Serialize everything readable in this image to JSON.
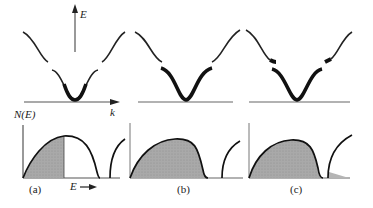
{
  "figure": {
    "axis_labels": {
      "energy": "E",
      "wavevector": "k",
      "density_of_states": "N(E)",
      "energy_arrow": "E"
    },
    "panels": [
      {
        "id": "a",
        "caption": "(a)",
        "description": "Partially filled lower band; states filled up to mid-band"
      },
      {
        "id": "b",
        "caption": "(b)",
        "description": "Lower band completely filled, upper band empty"
      },
      {
        "id": "c",
        "caption": "(c)",
        "description": "Overlapping bands; upper band partially filled"
      }
    ],
    "colors": {
      "curve": "#111111",
      "fill": "#a9a9a9",
      "axis": "#333333"
    }
  }
}
